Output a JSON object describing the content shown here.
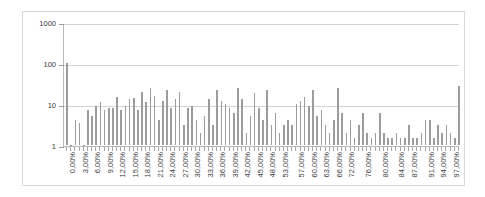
{
  "chart_data": {
    "type": "bar",
    "title": "",
    "xlabel": "",
    "ylabel": "",
    "yscale": "log",
    "ylim": [
      1,
      1000
    ],
    "ytick_labels": [
      "1",
      "10",
      "100",
      "1000"
    ],
    "ytick_values": [
      1,
      10,
      100,
      1000
    ],
    "grid": true,
    "legend": null,
    "bar_color": "#9c9c9c",
    "gridline_color": "#d2d2d2",
    "axis_color": "#b7b7b7",
    "border_color": "#d9d9d9",
    "background": "#ffffff",
    "xtick_step_percent": 1,
    "xlabel_step_percent": 3,
    "categories": [
      "0,00%",
      "1,00%",
      "2,00%",
      "3,00%",
      "4,00%",
      "5,00%",
      "6,00%",
      "7,00%",
      "8,00%",
      "9,00%",
      "10,00%",
      "11,00%",
      "12,00%",
      "13,00%",
      "14,00%",
      "15,00%",
      "16,00%",
      "17,00%",
      "18,00%",
      "19,00%",
      "20,00%",
      "21,00%",
      "22,00%",
      "23,00%",
      "24,00%",
      "25,00%",
      "26,00%",
      "27,00%",
      "28,00%",
      "29,00%",
      "30,00%",
      "31,00%",
      "32,00%",
      "33,00%",
      "34,00%",
      "35,00%",
      "36,00%",
      "37,00%",
      "38,00%",
      "39,00%",
      "40,00%",
      "41,00%",
      "42,00%",
      "43,00%",
      "44,00%",
      "45,00%",
      "46,00%",
      "47,00%",
      "48,00%",
      "49,00%",
      "50,00%",
      "53,00%",
      "54,00%",
      "55,00%",
      "56,00%",
      "57,00%",
      "58,00%",
      "59,00%",
      "60,00%",
      "61,00%",
      "62,00%",
      "63,00%",
      "64,00%",
      "65,00%",
      "66,00%",
      "67,00%",
      "68,00%",
      "72,00%",
      "73,00%",
      "74,00%",
      "75,00%",
      "76,00%",
      "77,00%",
      "78,00%",
      "79,00%",
      "80,00%",
      "81,00%",
      "82,00%",
      "83,00%",
      "84,00%",
      "85,00%",
      "86,00%",
      "87,00%",
      "88,00%",
      "89,00%",
      "90,00%",
      "91,00%",
      "92,00%",
      "93,00%",
      "94,00%",
      "95,00%",
      "96,00%",
      "97,00%",
      "98,00%",
      "99,00%"
    ],
    "tick_labels_shown": [
      "0,00%",
      "3,00%",
      "6,00%",
      "9,00%",
      "12,00%",
      "15,00%",
      "18,00%",
      "21,00%",
      "24,00%",
      "27,00%",
      "30,00%",
      "33,00%",
      "36,00%",
      "39,00%",
      "42,00%",
      "45,00%",
      "48,00%",
      "53,00%",
      "57,00%",
      "60,00%",
      "63,00%",
      "66,00%",
      "72,00%",
      "76,00%",
      "80,00%",
      "84,00%",
      "87,00%",
      "91,00%",
      "94,00%",
      "97,00%"
    ],
    "values": [
      98,
      1,
      4,
      3.5,
      1,
      7,
      5,
      9,
      11,
      7,
      8,
      8,
      15,
      7,
      9,
      13,
      14,
      7,
      20,
      11,
      24,
      16,
      4,
      12,
      22,
      8,
      13,
      20,
      3,
      8,
      9,
      4,
      2,
      5,
      13,
      3,
      22,
      12,
      10,
      8,
      6,
      25,
      13,
      2,
      5,
      19,
      8,
      4,
      22,
      3,
      6,
      2,
      3,
      4,
      3,
      10,
      12,
      15,
      9,
      22,
      5,
      7,
      3,
      2,
      4,
      24,
      6,
      2,
      4,
      1.5,
      3,
      6,
      2,
      1.5,
      2,
      6,
      2,
      1.5,
      1.5,
      2,
      1.5,
      1.5,
      3,
      1.5,
      1.5,
      2,
      4,
      4,
      1.5,
      3,
      2,
      3,
      2,
      1.5,
      28
    ]
  }
}
